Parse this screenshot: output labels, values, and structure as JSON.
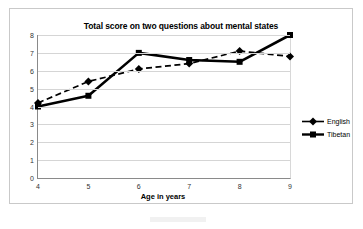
{
  "chart_data": {
    "type": "line",
    "title": "Total score on two questions about mental states",
    "xlabel": "Age in years",
    "ylabel": "",
    "categories": [
      4,
      5,
      6,
      7,
      8,
      9
    ],
    "xticks": [
      "4",
      "5",
      "6",
      "7",
      "8",
      "9"
    ],
    "yticks": [
      "0",
      "1",
      "2",
      "3",
      "4",
      "5",
      "6",
      "7",
      "8"
    ],
    "xlim": [
      4,
      9
    ],
    "ylim": [
      0,
      8
    ],
    "grid": "horizontal",
    "legend_position": "right",
    "series": [
      {
        "name": "English",
        "values": [
          4.2,
          5.4,
          6.1,
          6.4,
          7.1,
          6.8
        ],
        "marker": "diamond",
        "line_style": "dashed",
        "color": "#000000"
      },
      {
        "name": "Tibetan",
        "values": [
          4.0,
          4.6,
          7.0,
          6.6,
          6.5,
          8.0
        ],
        "marker": "square",
        "line_style": "solid",
        "color": "#000000"
      }
    ]
  },
  "legend": {
    "items": [
      {
        "label": "English",
        "marker": "diamond-marker-icon"
      },
      {
        "label": "Tibetan",
        "marker": "square-marker-icon"
      }
    ]
  }
}
